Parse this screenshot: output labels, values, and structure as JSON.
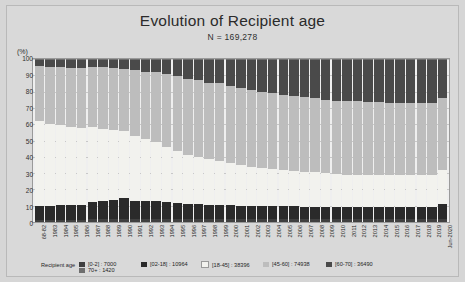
{
  "chart_data": {
    "type": "bar",
    "subtype": "stacked-100-percent",
    "title": "Evolution of Recipient age",
    "subtitle": "N = 169,278",
    "ylabel": "(%)",
    "xlabel": "",
    "ylim": [
      0,
      100
    ],
    "ytick_step": 10,
    "grid": true,
    "legend_position": "bottom",
    "legend_title": "Recipient age",
    "yticks": [
      "0",
      "10",
      "20",
      "30",
      "40",
      "50",
      "60",
      "70",
      "80",
      "90",
      "100"
    ],
    "categories": [
      "68-82",
      "1983",
      "1984",
      "1985",
      "1986",
      "1987",
      "1988",
      "1989",
      "1990",
      "1991",
      "1992",
      "1993",
      "1994",
      "1995",
      "1996",
      "1997",
      "1998",
      "1999",
      "2000",
      "2001",
      "2002",
      "2003",
      "2004",
      "2005",
      "2006",
      "2007",
      "2008",
      "2009",
      "2010",
      "2011",
      "2012",
      "2013",
      "2014",
      "2015",
      "2016",
      "2017",
      "2018",
      "2019",
      "Jun-2020"
    ],
    "series": [
      {
        "name": "[0-2]",
        "count": "7000",
        "color": "#3f3f3f",
        "values": [
          1.5,
          1.5,
          1.5,
          1.5,
          1.5,
          2.0,
          2.0,
          2.0,
          2.0,
          2.0,
          2.0,
          2.0,
          2.0,
          2.0,
          2.0,
          2.0,
          2.0,
          2.0,
          2.0,
          2.0,
          2.0,
          2.0,
          2.0,
          2.0,
          2.0,
          2.0,
          2.0,
          2.0,
          2.0,
          2.0,
          2.0,
          2.0,
          2.0,
          2.0,
          2.0,
          2.0,
          2.0,
          2.0,
          2.0
        ]
      },
      {
        "name": "[02-18]",
        "count": "10964",
        "color": "#2a2a2a",
        "values": [
          8.5,
          8.5,
          9.0,
          9.0,
          9.0,
          10.0,
          11.0,
          11.5,
          13.0,
          11.0,
          11.0,
          11.0,
          10.0,
          9.5,
          9.0,
          9.0,
          8.5,
          8.5,
          8.5,
          8.0,
          8.0,
          8.0,
          8.0,
          8.0,
          8.0,
          7.5,
          7.5,
          7.5,
          7.5,
          7.0,
          7.0,
          7.0,
          7.0,
          7.0,
          7.0,
          7.0,
          7.0,
          7.0,
          9.0
        ]
      },
      {
        "name": "[18-45]",
        "count": "38396",
        "color": "#f2f2ee",
        "values": [
          52.0,
          50.0,
          49.0,
          48.0,
          47.0,
          46.0,
          44.0,
          43.0,
          41.0,
          40.0,
          38.0,
          36.0,
          34.0,
          32.0,
          30.0,
          29.0,
          28.0,
          27.0,
          26.0,
          25.0,
          24.0,
          23.0,
          22.5,
          22.0,
          21.5,
          21.0,
          21.0,
          20.5,
          20.0,
          20.0,
          20.0,
          20.0,
          20.0,
          20.0,
          20.0,
          20.0,
          20.0,
          20.0,
          21.0
        ]
      },
      {
        "name": "[45-60]",
        "count": "74938",
        "color": "#bdbdbd",
        "values": [
          34.0,
          35.0,
          35.5,
          36.0,
          37.0,
          37.0,
          38.0,
          38.0,
          38.0,
          40.0,
          41.0,
          43.0,
          45.0,
          46.0,
          47.0,
          47.0,
          47.0,
          47.5,
          47.0,
          47.0,
          47.0,
          47.0,
          46.5,
          46.0,
          46.0,
          46.0,
          45.5,
          45.0,
          45.0,
          45.0,
          45.0,
          44.5,
          44.5,
          44.0,
          44.0,
          44.0,
          44.0,
          44.0,
          44.0
        ]
      },
      {
        "name": "[60-70]",
        "count": "36490",
        "color": "#4a4a4a",
        "values": [
          3.5,
          4.5,
          4.5,
          5.0,
          5.0,
          4.5,
          4.5,
          5.0,
          5.5,
          6.5,
          7.5,
          7.5,
          8.5,
          10.0,
          11.5,
          12.5,
          13.8,
          14.5,
          16.0,
          17.5,
          18.5,
          19.5,
          20.5,
          21.5,
          22.0,
          23.0,
          23.5,
          24.5,
          25.0,
          25.5,
          25.5,
          26.0,
          26.0,
          26.5,
          26.5,
          26.5,
          26.5,
          26.5,
          23.5
        ]
      },
      {
        "name": "70+",
        "count": "1420",
        "color": "#6e6e6e",
        "values": [
          0.5,
          0.5,
          0.5,
          0.5,
          0.5,
          0.5,
          0.5,
          0.5,
          0.5,
          0.5,
          0.5,
          0.5,
          0.5,
          0.5,
          0.5,
          0.5,
          0.7,
          0.5,
          0.5,
          0.5,
          0.5,
          0.5,
          0.5,
          0.5,
          0.5,
          0.5,
          0.5,
          0.5,
          0.5,
          0.5,
          0.5,
          0.5,
          0.5,
          0.5,
          0.5,
          0.5,
          0.5,
          0.5,
          0.5
        ]
      }
    ]
  }
}
